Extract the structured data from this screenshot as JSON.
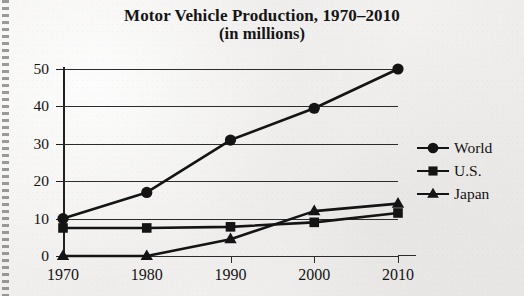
{
  "figure": {
    "title_line1": "Motor Vehicle Production, 1970–2010",
    "title_line2": "(in millions)"
  },
  "chart_data": {
    "type": "line",
    "title": "Motor Vehicle Production, 1970–2010 (in millions)",
    "subtitle": "(in millions)",
    "xlabel": "",
    "ylabel": "",
    "x": [
      1970,
      1980,
      1990,
      2000,
      2010
    ],
    "categories": [
      "1970",
      "1980",
      "1990",
      "2000",
      "2010"
    ],
    "xlim": [
      1970,
      2010
    ],
    "ylim": [
      0,
      50
    ],
    "yticks": [
      0,
      10,
      20,
      30,
      40,
      50
    ],
    "ytick_labels": [
      "0",
      "10",
      "20",
      "30",
      "40",
      "50"
    ],
    "grid": "horizontal",
    "legend_position": "right",
    "series": [
      {
        "name": "World",
        "marker": "circle",
        "color": "#141414",
        "values": [
          10,
          17,
          31,
          39.5,
          50
        ]
      },
      {
        "name": "U.S.",
        "marker": "square",
        "color": "#141414",
        "values": [
          7.5,
          7.5,
          7.8,
          9,
          11.5
        ]
      },
      {
        "name": "Japan",
        "marker": "triangle",
        "color": "#141414",
        "values": [
          0,
          0,
          4.5,
          12,
          14
        ]
      }
    ]
  },
  "legend": {
    "entries": [
      {
        "label": "World",
        "marker": "circle"
      },
      {
        "label": "U.S.",
        "marker": "square"
      },
      {
        "label": "Japan",
        "marker": "triangle"
      }
    ]
  }
}
